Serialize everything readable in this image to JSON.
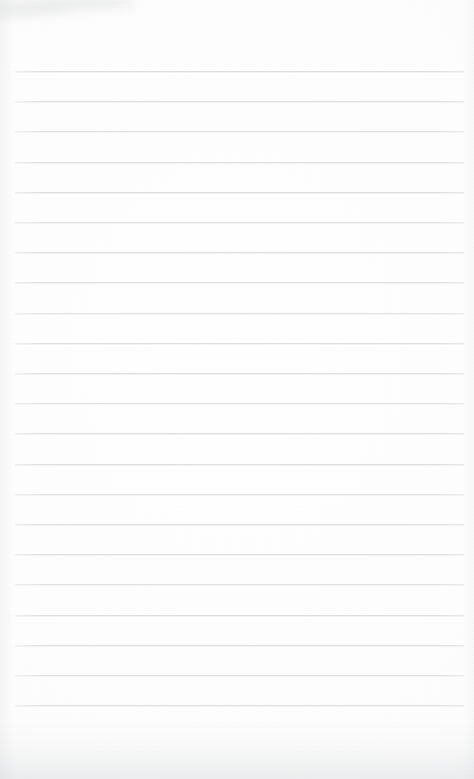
{
  "document": {
    "type": "scanned-lined-paper",
    "title": "Blank ruled notebook page",
    "content_text": "",
    "page_width": 474,
    "page_height": 779,
    "background_color": "#fdfdfd",
    "paper_color": "#ffffff"
  },
  "ruling": {
    "line_color": "#dcdfe0",
    "line_count": 22,
    "line_thickness_px": 1,
    "line_spacing_px": 30.2,
    "first_line_y": 71,
    "last_line_y": 705,
    "line_left_x": 15,
    "line_right_x": 464,
    "margin_rule": "none",
    "top_margin_px": 71,
    "bottom_margin_px": 74,
    "lines": [
      {
        "index": 1,
        "y": 71,
        "left": 15,
        "right": 464,
        "text": ""
      },
      {
        "index": 2,
        "y": 101,
        "left": 15,
        "right": 464,
        "text": ""
      },
      {
        "index": 3,
        "y": 131,
        "left": 15,
        "right": 464,
        "text": ""
      },
      {
        "index": 4,
        "y": 162,
        "left": 15,
        "right": 464,
        "text": ""
      },
      {
        "index": 5,
        "y": 192,
        "left": 15,
        "right": 464,
        "text": ""
      },
      {
        "index": 6,
        "y": 222,
        "left": 15,
        "right": 464,
        "text": ""
      },
      {
        "index": 7,
        "y": 252,
        "left": 15,
        "right": 464,
        "text": ""
      },
      {
        "index": 8,
        "y": 282,
        "left": 15,
        "right": 464,
        "text": ""
      },
      {
        "index": 9,
        "y": 313,
        "left": 15,
        "right": 464,
        "text": ""
      },
      {
        "index": 10,
        "y": 343,
        "left": 15,
        "right": 464,
        "text": ""
      },
      {
        "index": 11,
        "y": 373,
        "left": 15,
        "right": 464,
        "text": ""
      },
      {
        "index": 12,
        "y": 403,
        "left": 15,
        "right": 464,
        "text": ""
      },
      {
        "index": 13,
        "y": 433,
        "left": 15,
        "right": 464,
        "text": ""
      },
      {
        "index": 14,
        "y": 464,
        "left": 15,
        "right": 464,
        "text": ""
      },
      {
        "index": 15,
        "y": 494,
        "left": 15,
        "right": 464,
        "text": ""
      },
      {
        "index": 16,
        "y": 524,
        "left": 15,
        "right": 464,
        "text": ""
      },
      {
        "index": 17,
        "y": 554,
        "left": 15,
        "right": 464,
        "text": ""
      },
      {
        "index": 18,
        "y": 584,
        "left": 15,
        "right": 464,
        "text": ""
      },
      {
        "index": 19,
        "y": 615,
        "left": 15,
        "right": 464,
        "text": ""
      },
      {
        "index": 20,
        "y": 645,
        "left": 15,
        "right": 464,
        "text": ""
      },
      {
        "index": 21,
        "y": 675,
        "left": 15,
        "right": 464,
        "text": ""
      },
      {
        "index": 22,
        "y": 705,
        "left": 15,
        "right": 464,
        "text": ""
      }
    ]
  },
  "artifacts": {
    "top_left_smudge": {
      "present": true,
      "color": "#9aa0a3"
    },
    "bottom_edge_shading": {
      "present": true,
      "color": "#9ca2a6"
    },
    "left_edge_shading": {
      "present": true,
      "color": "#a5aaae"
    },
    "right_edge_shading": {
      "present": true,
      "color": "#a8acb0"
    }
  }
}
